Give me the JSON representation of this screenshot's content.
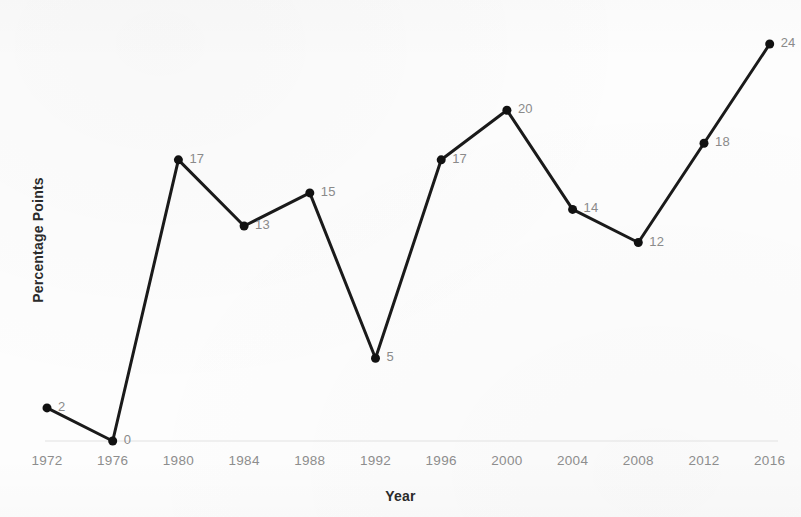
{
  "chart_data": {
    "type": "line",
    "title": "",
    "subtitle": "",
    "xlabel": "Year",
    "ylabel": "Percentage Points",
    "categories": [
      1972,
      1976,
      1980,
      1984,
      1988,
      1992,
      1996,
      2000,
      2004,
      2008,
      2012,
      2016
    ],
    "x_tick_labels": [
      "1972",
      "1976",
      "1980",
      "1984",
      "1988",
      "1992",
      "1996",
      "2000",
      "2004",
      "2008",
      "2012",
      "2016"
    ],
    "values": [
      2,
      0,
      17,
      13,
      15,
      5,
      17,
      20,
      14,
      12,
      18,
      24
    ],
    "point_labels": [
      "2",
      "0",
      "17",
      "13",
      "15",
      "5",
      "17",
      "20",
      "14",
      "12",
      "18",
      "24"
    ],
    "series": [
      {
        "name": "Percentage Points",
        "values": [
          2,
          0,
          17,
          13,
          15,
          5,
          17,
          20,
          14,
          12,
          18,
          24
        ]
      }
    ],
    "xlim": [
      1972,
      2016
    ],
    "ylim": [
      0,
      24
    ],
    "y_tick_labels": [],
    "grid": "baseline-only",
    "legend": "none",
    "colors": {
      "line": "#1a1a1a",
      "marker": "#111111",
      "point_label": "#8a8a8a",
      "tick_label": "#8d8d8d",
      "axis_title": "#2b2b2b",
      "gridline": "#e2e2e2",
      "background": "#fdfdfd"
    },
    "line_width_px": 3,
    "marker_size_px": 9,
    "marker_shape": "circle"
  }
}
